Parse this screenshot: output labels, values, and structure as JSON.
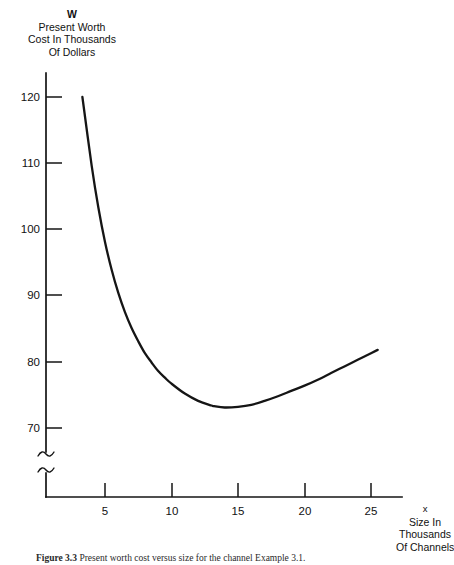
{
  "figure": {
    "caption_label": "Figure 3.3",
    "caption_text": "Present worth cost versus size for the channel Example 3.1.",
    "background_color": "#ffffff",
    "ink_color": "#141414"
  },
  "y_axis": {
    "symbol": "W",
    "title_lines": [
      "Present Worth",
      "Cost In Thousands",
      "Of Dollars"
    ],
    "tick_labels": [
      "120",
      "110",
      "100",
      "90",
      "80",
      "70"
    ],
    "has_axis_break": true,
    "break_icon": "axis-break-squiggle"
  },
  "x_axis": {
    "symbol": "x",
    "title_lines": [
      "Size In",
      "Thousands",
      "Of Channels"
    ],
    "tick_labels": [
      "5",
      "10",
      "15",
      "20",
      "25"
    ]
  },
  "chart_data": {
    "type": "line",
    "title": "",
    "xlabel": "x  Size In Thousands Of Channels",
    "ylabel": "W  Present Worth Cost In Thousands Of Dollars",
    "xlim": [
      0,
      26.5
    ],
    "ylim": [
      66.5,
      124
    ],
    "grid": false,
    "legend": "none",
    "y_axis_break": true,
    "y_axis_break_below": 70,
    "xticks": [
      5,
      10,
      15,
      20,
      25
    ],
    "yticks": [
      70,
      80,
      90,
      100,
      110,
      120
    ],
    "series": [
      {
        "name": "Present worth cost",
        "x": [
          3.3,
          4.0,
          4.5,
          5.0,
          5.5,
          6.0,
          6.5,
          7.0,
          7.5,
          8.0,
          8.5,
          9.0,
          9.5,
          10.0,
          11.0,
          12.0,
          13.0,
          13.2,
          14.0,
          15.0,
          16.0,
          17.0,
          18.0,
          19.0,
          20.0,
          21.0,
          22.0,
          23.0,
          24.0,
          25.0,
          25.5
        ],
        "y": [
          120.0,
          109.6,
          103.3,
          98.1,
          93.9,
          90.4,
          87.5,
          85.1,
          83.1,
          81.3,
          79.9,
          78.6,
          77.6,
          76.7,
          75.2,
          74.1,
          73.4,
          73.3,
          73.1,
          73.2,
          73.5,
          74.1,
          74.8,
          75.6,
          76.4,
          77.3,
          78.3,
          79.3,
          80.3,
          81.3,
          81.8
        ]
      }
    ],
    "annotations": [
      {
        "name": "curve-minimum",
        "x": 13.3,
        "y": 72.6,
        "label": ""
      }
    ]
  }
}
